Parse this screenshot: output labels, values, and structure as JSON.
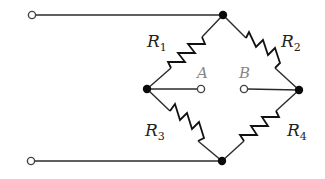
{
  "diagram": {
    "type": "wheatstone-bridge-circuit",
    "resistors": [
      {
        "id": "R1",
        "label": "R",
        "sub": "1",
        "between": [
          "top",
          "left"
        ]
      },
      {
        "id": "R2",
        "label": "R",
        "sub": "2",
        "between": [
          "top",
          "right"
        ]
      },
      {
        "id": "R3",
        "label": "R",
        "sub": "3",
        "between": [
          "left",
          "bottom"
        ]
      },
      {
        "id": "R4",
        "label": "R",
        "sub": "4",
        "between": [
          "right",
          "bottom"
        ]
      }
    ],
    "terminals": {
      "A": "A",
      "B": "B"
    },
    "nodes": [
      "top",
      "left",
      "right",
      "bottom"
    ],
    "input_terminals": [
      "input-top",
      "input-bottom"
    ],
    "colors": {
      "wire": "#2a2a2a",
      "node": "#0a0a0a",
      "terminal_label": "#888888",
      "resistor_label": "#222222"
    }
  }
}
